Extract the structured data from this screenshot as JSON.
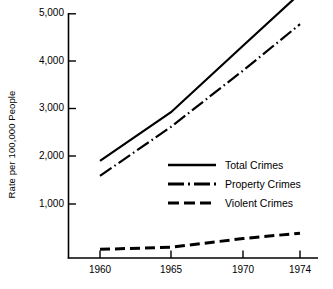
{
  "chart_data": {
    "type": "line",
    "title": "",
    "xlabel": "",
    "ylabel": "Rate per 100,000 People",
    "x": [
      1960,
      1965,
      1970,
      1974
    ],
    "xtick_labels": [
      "1960",
      "1965",
      "1970",
      "1974"
    ],
    "ytick_labels": [
      "1,000",
      "2,000",
      "3,000",
      "4,000",
      "5,000"
    ],
    "ytick_values": [
      1000,
      2000,
      3000,
      4000,
      5000
    ],
    "xlim": [
      1958.2,
      1975.8
    ],
    "ylim": [
      0,
      5300
    ],
    "grid": false,
    "legend_position": "inside-center-right",
    "series": [
      {
        "name": "Total Crimes",
        "style": "solid",
        "values": [
          1800,
          2700,
          3930,
          4900
        ]
      },
      {
        "name": "Property Crimes",
        "style": "dash-dot",
        "values": [
          1520,
          2430,
          3470,
          4330
        ]
      },
      {
        "name": "Violent Crimes",
        "style": "dashed",
        "values": [
          160,
          200,
          360,
          460
        ]
      }
    ]
  },
  "axes": {
    "y_title": "Rate per 100,000 People",
    "y_ticks": [
      {
        "label": "5,000"
      },
      {
        "label": "4,000"
      },
      {
        "label": "3,000"
      },
      {
        "label": "2,000"
      },
      {
        "label": "1,000"
      }
    ],
    "x_ticks": [
      {
        "label": "1960"
      },
      {
        "label": "1965"
      },
      {
        "label": "1970"
      },
      {
        "label": "1974"
      }
    ]
  },
  "legend": {
    "items": [
      {
        "label": "Total Crimes",
        "style": "solid"
      },
      {
        "label": "Property Crimes",
        "style": "dash-dot"
      },
      {
        "label": "Violent Crimes",
        "style": "dashed"
      }
    ]
  },
  "colors": {
    "ink": "#000000",
    "background": "#ffffff"
  }
}
